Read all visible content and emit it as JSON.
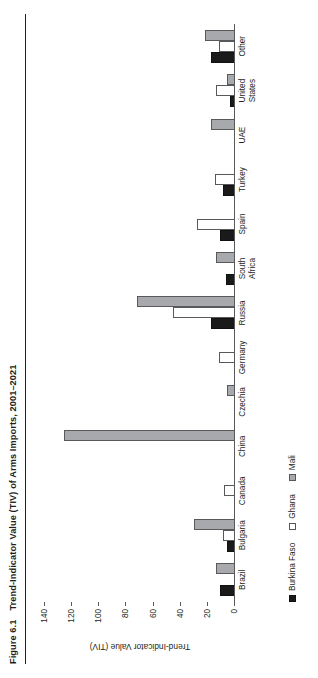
{
  "figure": {
    "number": "Figure 6.1",
    "title": "Trend-Indicator Value (TIV) of Arms Imports, 2001–2021"
  },
  "chart_data": {
    "type": "bar",
    "title": "Trend-Indicator Value (TIV) of Arms Imports, 2001–2021",
    "xlabel": "",
    "ylabel": "Trend-Indicator Value (TIV)",
    "ylim": [
      0,
      140
    ],
    "yticks": [
      0,
      20,
      40,
      60,
      80,
      100,
      120,
      140
    ],
    "grid": false,
    "legend_position": "bottom-left",
    "orientation": "vertical",
    "categories": [
      "Brazil",
      "Bulgaria",
      "Canada",
      "China",
      "Czechia",
      "Germany",
      "Russia",
      "South Africa",
      "Spain",
      "Turkey",
      "UAE",
      "United States",
      "Other"
    ],
    "series": [
      {
        "name": "Burkina Faso",
        "color": "#1a1a1a",
        "values": [
          11,
          6,
          0,
          0,
          0,
          0,
          18,
          7,
          11,
          9,
          0,
          4,
          18
        ]
      },
      {
        "name": "Ghana",
        "color": "#ffffff",
        "values": [
          0,
          9,
          8,
          0,
          0,
          12,
          46,
          0,
          28,
          15,
          0,
          14,
          12
        ]
      },
      {
        "name": "Mali",
        "color": "#a7a9ac",
        "values": [
          14,
          30,
          0,
          126,
          6,
          0,
          72,
          14,
          0,
          0,
          18,
          6,
          22
        ]
      }
    ]
  },
  "legend": {
    "items": [
      {
        "label": "Burkina Faso",
        "swatch": "black-filled-square"
      },
      {
        "label": "Ghana",
        "swatch": "white-open-square"
      },
      {
        "label": "Mali",
        "swatch": "gray-filled-square"
      }
    ]
  },
  "axis": {
    "y_title": "Trend-Indicator Value (TIV)",
    "tick_labels": [
      "140",
      "120",
      "100",
      "80",
      "60",
      "40",
      "20",
      "0"
    ]
  }
}
